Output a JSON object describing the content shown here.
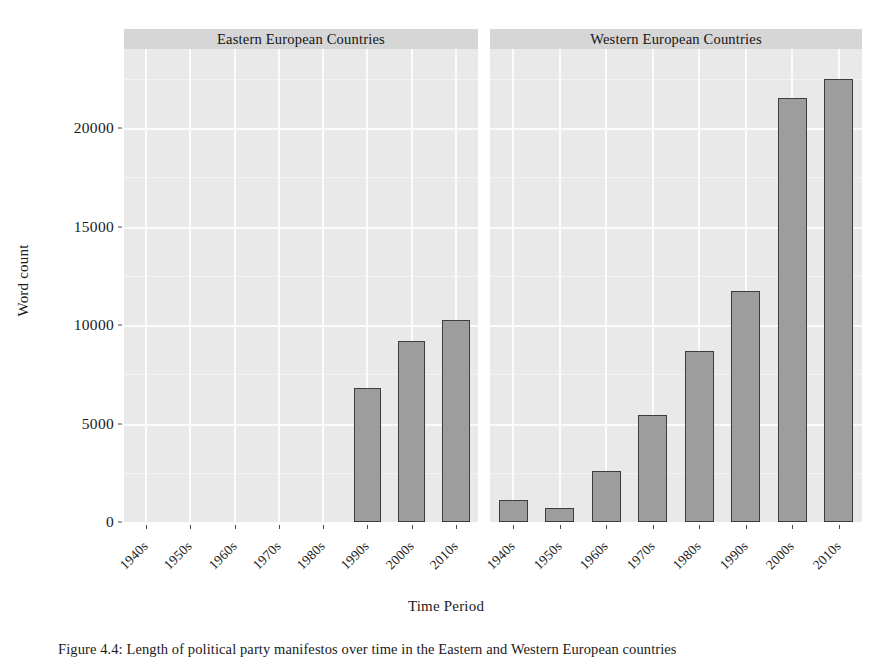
{
  "figure": {
    "caption": "Figure 4.4: Length of political party manifestos over time in the Eastern and Western European countries"
  },
  "axes": {
    "ylabel": "Word count",
    "xlabel": "Time Period",
    "yticks": [
      "0",
      "5000",
      "10000",
      "15000",
      "20000"
    ]
  },
  "chart_data": {
    "type": "bar",
    "title": "",
    "xlabel": "Time Period",
    "ylabel": "Word count",
    "ylim": [
      0,
      23500
    ],
    "yticks": [
      0,
      5000,
      10000,
      15000,
      20000
    ],
    "grid": true,
    "legend": "none",
    "facet_layout": "1x2 columns, shared y-axis",
    "categories": [
      "1940s",
      "1950s",
      "1960s",
      "1970s",
      "1980s",
      "1990s",
      "2000s",
      "2010s"
    ],
    "panels": [
      {
        "title": "Eastern European Countries",
        "categories": [
          "1940s",
          "1950s",
          "1960s",
          "1970s",
          "1980s",
          "1990s",
          "2000s",
          "2010s"
        ],
        "values": [
          0,
          0,
          0,
          0,
          0,
          6800,
          9200,
          10250
        ]
      },
      {
        "title": "Western European Countries",
        "categories": [
          "1940s",
          "1950s",
          "1960s",
          "1970s",
          "1980s",
          "1990s",
          "2000s",
          "2010s"
        ],
        "values": [
          1120,
          700,
          2600,
          5430,
          8680,
          11730,
          21500,
          22500
        ]
      }
    ]
  },
  "style": {
    "bar_fill": "#9d9d9d",
    "bar_border": "#3d3d3d",
    "panel_bg": "#e9e9e9",
    "strip_bg": "#d6d6d6",
    "grid_color": "#fbfbfb",
    "text_color": "#1a1a1a"
  }
}
